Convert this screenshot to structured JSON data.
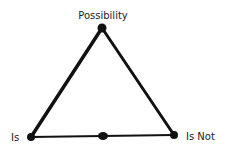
{
  "diagram": {
    "type": "triangle",
    "colors": {
      "stroke": "#111111",
      "label": "#222222",
      "background": "#ffffff"
    },
    "nodes": [
      {
        "id": "top",
        "label": "Possibility"
      },
      {
        "id": "left",
        "label": "Is"
      },
      {
        "id": "right",
        "label": "Is Not"
      }
    ],
    "edges": [
      {
        "from": "left",
        "to": "top"
      },
      {
        "from": "top",
        "to": "right"
      },
      {
        "from": "left",
        "to": "right",
        "midpoint_marker": true
      }
    ]
  }
}
